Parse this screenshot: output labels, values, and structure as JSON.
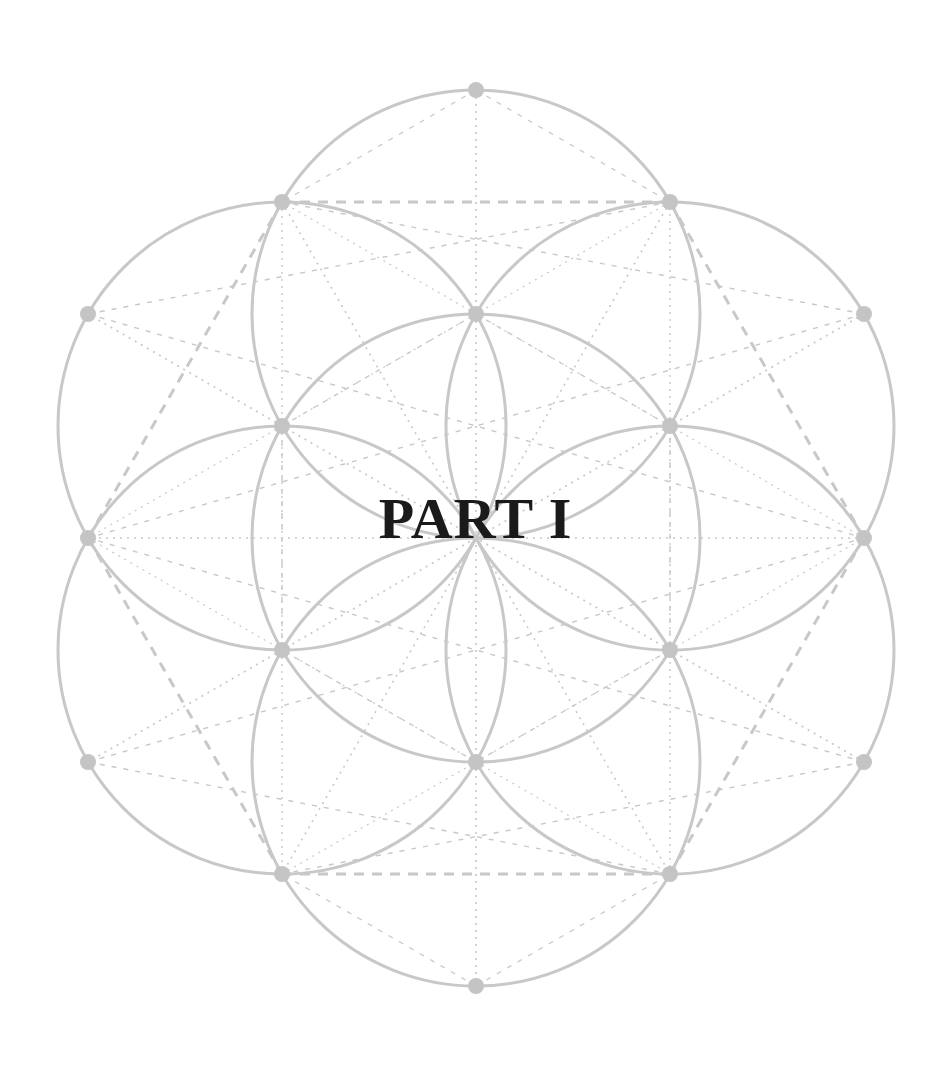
{
  "page": {
    "title": "PART I"
  },
  "figure": {
    "type": "seed-of-life geometric diagram",
    "center": [
      476,
      538
    ],
    "radius": 224,
    "stroke_color": "#c8c8c8",
    "dot_color": "#c4c4c4",
    "text_color": "#1a1a1a"
  }
}
